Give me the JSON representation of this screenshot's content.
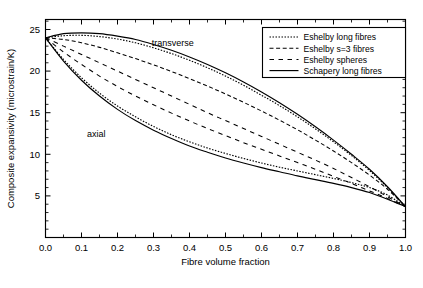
{
  "chart_data": {
    "type": "line",
    "title": "",
    "xlabel": "Fibre volume fraction",
    "ylabel": "Composite expansivity (microstrain/K)",
    "xlim": [
      0.0,
      1.0
    ],
    "ylim": [
      0.0,
      26.2
    ],
    "xticks": [
      0.0,
      0.1,
      0.2,
      0.3,
      0.4,
      0.5,
      0.6,
      0.7,
      0.8,
      0.9,
      1.0
    ],
    "xticklabels": [
      "0.0",
      "0.1",
      "0.2",
      "0.3",
      "0.4",
      "0.5",
      "0.6",
      "0.7",
      "0.8",
      "0.9",
      "1.0"
    ],
    "yticks": [
      5,
      10,
      15,
      20,
      25
    ],
    "yticklabels": [
      "5",
      "10",
      "15",
      "20",
      "25"
    ],
    "xminor_step": 0.05,
    "yminor_step": 1,
    "grid": false,
    "frame": true,
    "legend_position": "upper-right",
    "annotations": [
      {
        "text": "transverse",
        "x": 0.295,
        "y": 23.0
      },
      {
        "text": "axial",
        "x": 0.115,
        "y": 12.1
      }
    ],
    "x": [
      0.0,
      0.05,
      0.1,
      0.15,
      0.2,
      0.25,
      0.3,
      0.35,
      0.4,
      0.45,
      0.5,
      0.55,
      0.6,
      0.65,
      0.7,
      0.75,
      0.8,
      0.85,
      0.9,
      0.95,
      1.0
    ],
    "series": [
      {
        "name": "Schapery long fibres",
        "branch": "transverse",
        "style": "solid",
        "values": [
          24.0,
          24.5,
          24.6,
          24.5,
          24.2,
          23.8,
          23.2,
          22.5,
          21.7,
          20.8,
          19.8,
          18.7,
          17.5,
          16.2,
          14.8,
          13.3,
          11.7,
          10.0,
          8.2,
          6.1,
          3.7
        ]
      },
      {
        "name": "Eshelby long fibres",
        "branch": "transverse",
        "style": "dotted",
        "values": [
          24.0,
          24.25,
          24.3,
          24.15,
          23.85,
          23.4,
          22.8,
          22.1,
          21.3,
          20.4,
          19.4,
          18.3,
          17.1,
          15.85,
          14.5,
          13.05,
          11.5,
          9.85,
          8.05,
          6.0,
          3.7
        ]
      },
      {
        "name": "Eshelby s=3 fibres",
        "branch": "transverse",
        "style": "dashed-medium",
        "values": [
          24.0,
          23.8,
          23.4,
          22.85,
          22.2,
          21.5,
          20.75,
          19.95,
          19.1,
          18.2,
          17.25,
          16.25,
          15.2,
          14.1,
          12.95,
          11.7,
          10.4,
          9.0,
          7.5,
          5.8,
          3.7
        ]
      },
      {
        "name": "Eshelby spheres",
        "branch": "transverse",
        "style": "dashed-long",
        "values": [
          24.0,
          23.0,
          22.0,
          21.0,
          20.0,
          19.0,
          18.0,
          17.0,
          16.0,
          15.0,
          14.05,
          13.1,
          12.15,
          11.2,
          10.25,
          9.3,
          8.3,
          7.2,
          6.1,
          4.9,
          3.7
        ]
      },
      {
        "name": "Eshelby spheres",
        "branch": "transverse-lower",
        "style": "dashed-long",
        "values": [
          24.0,
          22.3,
          20.8,
          19.4,
          18.15,
          17.0,
          15.95,
          14.95,
          14.0,
          13.1,
          12.25,
          11.4,
          10.6,
          9.8,
          9.0,
          8.2,
          7.35,
          6.5,
          5.6,
          4.7,
          3.7
        ]
      },
      {
        "name": "Schapery long fibres",
        "branch": "axial",
        "style": "solid",
        "values": [
          24.0,
          21.2,
          18.9,
          17.0,
          15.4,
          14.05,
          12.9,
          11.9,
          11.0,
          10.25,
          9.55,
          8.95,
          8.4,
          7.9,
          7.4,
          6.95,
          6.5,
          6.0,
          5.4,
          4.6,
          3.7
        ]
      },
      {
        "name": "Eshelby long fibres",
        "branch": "axial",
        "style": "dotted",
        "values": [
          24.0,
          21.4,
          19.2,
          17.35,
          15.8,
          14.5,
          13.35,
          12.35,
          11.5,
          10.75,
          10.1,
          9.5,
          8.95,
          8.45,
          8.0,
          7.55,
          7.1,
          6.6,
          6.0,
          5.1,
          3.7
        ]
      }
    ],
    "legend": [
      {
        "label": "Eshelby long fibres",
        "style": "dotted"
      },
      {
        "label": "Eshelby s=3 fibres",
        "style": "dashed-medium"
      },
      {
        "label": "Eshelby spheres",
        "style": "dashed-long"
      },
      {
        "label": "Schapery long fibres",
        "style": "solid"
      }
    ]
  }
}
